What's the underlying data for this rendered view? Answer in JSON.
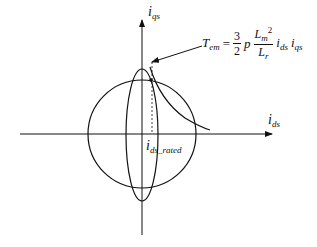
{
  "diagram": {
    "type": "current-limit-circle-and-voltage-ellipse",
    "axes": {
      "x_label_main": "i",
      "x_label_sub": "ds",
      "y_label_main": "i",
      "y_label_sub": "qs"
    },
    "rated_label_main": "i",
    "rated_label_sub": "ds_rated",
    "equation": {
      "lhs_main": "T",
      "lhs_sub": "em",
      "equals": "=",
      "frac1_num": "3",
      "frac1_den": "2",
      "p": "p",
      "frac2_num_main": "L",
      "frac2_num_sub": "m",
      "frac2_num_sup": "2",
      "frac2_den_main": "L",
      "frac2_den_sub": "r",
      "ids_main": "i",
      "ids_sub": "ds",
      "iqs_main": "i",
      "iqs_sub": "qs"
    },
    "colors": {
      "stroke": "#111111",
      "background": "#ffffff"
    }
  }
}
